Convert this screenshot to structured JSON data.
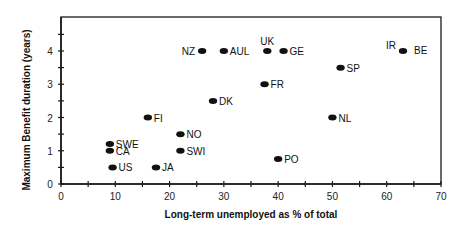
{
  "chart_data": {
    "type": "scatter",
    "title": "",
    "xlabel": "Long-term unemployed as % of total",
    "ylabel": "Maximum Benefit duration (years)",
    "xlim": [
      0,
      70
    ],
    "ylim": [
      0,
      5
    ],
    "xticks": [
      0,
      10,
      20,
      30,
      40,
      50,
      60,
      70
    ],
    "xminor": [
      5,
      15,
      25,
      35,
      45,
      55,
      65
    ],
    "yticks": [
      0,
      1,
      2,
      3,
      4
    ],
    "yminor": [
      0.5,
      1.5,
      2.5,
      3.5,
      4.5
    ],
    "grid": false,
    "legend": null,
    "points": [
      {
        "label": "NZ",
        "x": 26,
        "y": 4.0,
        "label_pos": "left"
      },
      {
        "label": "AUL",
        "x": 30,
        "y": 4.0,
        "label_pos": "right"
      },
      {
        "label": "UK",
        "x": 38,
        "y": 4.0,
        "label_pos": "above"
      },
      {
        "label": "GE",
        "x": 41,
        "y": 4.0,
        "label_pos": "right"
      },
      {
        "label": "IR",
        "x": 63,
        "y": 4.0,
        "label_pos": "upper-left"
      },
      {
        "label": "BE",
        "x": 63,
        "y": 4.0,
        "label_pos": "right-far"
      },
      {
        "label": "SP",
        "x": 51.5,
        "y": 3.5,
        "label_pos": "right"
      },
      {
        "label": "FR",
        "x": 37.5,
        "y": 3.0,
        "label_pos": "right"
      },
      {
        "label": "DK",
        "x": 28,
        "y": 2.5,
        "label_pos": "right"
      },
      {
        "label": "FI",
        "x": 16,
        "y": 2.0,
        "label_pos": "right"
      },
      {
        "label": "NL",
        "x": 50,
        "y": 2.0,
        "label_pos": "right"
      },
      {
        "label": "NO",
        "x": 22,
        "y": 1.5,
        "label_pos": "right"
      },
      {
        "label": "SWE",
        "x": 9,
        "y": 1.2,
        "label_pos": "right"
      },
      {
        "label": "CA",
        "x": 9,
        "y": 1.0,
        "label_pos": "right"
      },
      {
        "label": "SWI",
        "x": 22,
        "y": 1.0,
        "label_pos": "right"
      },
      {
        "label": "PO",
        "x": 40,
        "y": 0.75,
        "label_pos": "right"
      },
      {
        "label": "US",
        "x": 9.5,
        "y": 0.5,
        "label_pos": "right"
      },
      {
        "label": "JA",
        "x": 17.5,
        "y": 0.5,
        "label_pos": "right"
      }
    ]
  },
  "style": {
    "axis_color": "#1a1a1a",
    "marker_color": "#111111",
    "background": "#ffffff"
  }
}
